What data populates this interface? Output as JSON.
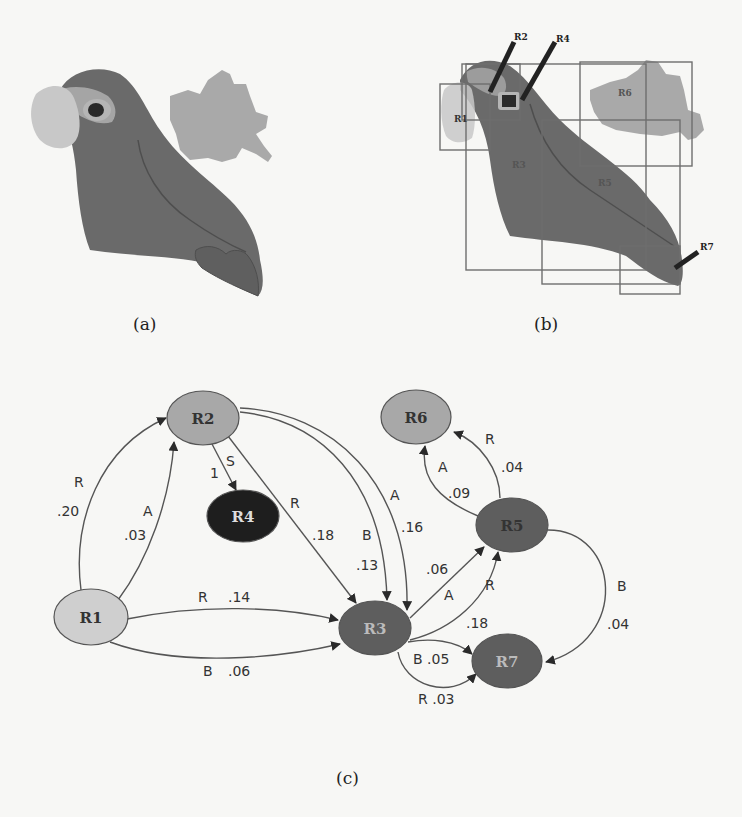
{
  "figure": {
    "panels": [
      {
        "id": "a",
        "caption": "(a)",
        "description": "Segmented parrot image with leaf"
      },
      {
        "id": "b",
        "caption": "(b)",
        "description": "Region bounding boxes overlaid on parrot"
      },
      {
        "id": "c",
        "caption": "(c)",
        "description": "Spatial relation graph between regions"
      }
    ],
    "region_labels": {
      "R1": "R1",
      "R2": "R2",
      "R3": "R3",
      "R4": "R4",
      "R5": "R5",
      "R6": "R6",
      "R7": "R7"
    },
    "colors": {
      "background": "#f7f7f5",
      "parrot_body": "#6a6a6a",
      "parrot_face": "#c8c8c8",
      "parrot_cheek": "#a5a5a5",
      "eye": "#2a2a2a",
      "leaf": "#a9a9a9",
      "box_stroke": "#6e6e6e",
      "node_R1": "#cfcfcf",
      "node_R2": "#a8a8a8",
      "node_R3": "#5e5e5e",
      "node_R4": "#1e1e1e",
      "node_R5": "#5e5e5e",
      "node_R6": "#a8a8a8",
      "node_R7": "#5e5e5e",
      "edge": "#555555"
    }
  },
  "graph": {
    "nodes": [
      {
        "id": "R1",
        "label": "R1",
        "cx": 91,
        "cy": 617
      },
      {
        "id": "R2",
        "label": "R2",
        "cx": 203,
        "cy": 418
      },
      {
        "id": "R3",
        "label": "R3",
        "cx": 375,
        "cy": 628
      },
      {
        "id": "R4",
        "label": "R4",
        "cx": 243,
        "cy": 516
      },
      {
        "id": "R5",
        "label": "R5",
        "cx": 512,
        "cy": 525
      },
      {
        "id": "R6",
        "label": "R6",
        "cx": 408,
        "cy": 418
      },
      {
        "id": "R7",
        "label": "R7",
        "cx": 507,
        "cy": 661
      }
    ],
    "edges": [
      {
        "from": "R1",
        "to": "R2",
        "relation": "R",
        "weight": ".20"
      },
      {
        "from": "R1",
        "to": "R2",
        "relation": "A",
        "weight": ".03"
      },
      {
        "from": "R2",
        "to": "R4",
        "relation": "S",
        "weight": "1"
      },
      {
        "from": "R2",
        "to": "R3",
        "relation": "R",
        "weight": ".18"
      },
      {
        "from": "R2",
        "to": "R3",
        "relation": "B",
        "weight": ".13"
      },
      {
        "from": "R2",
        "to": "R3",
        "relation": "A",
        "weight": ".16"
      },
      {
        "from": "R1",
        "to": "R3",
        "relation": "R",
        "weight": ".14"
      },
      {
        "from": "R1",
        "to": "R3",
        "relation": "B",
        "weight": ".06"
      },
      {
        "from": "R3",
        "to": "R5",
        "relation": "A",
        "weight": ".06"
      },
      {
        "from": "R3",
        "to": "R5",
        "relation": "R",
        "weight": ".18"
      },
      {
        "from": "R5",
        "to": "R6",
        "relation": "A",
        "weight": ".09"
      },
      {
        "from": "R5",
        "to": "R6",
        "relation": "R",
        "weight": ".04"
      },
      {
        "from": "R5",
        "to": "R7",
        "relation": "B",
        "weight": ".04"
      },
      {
        "from": "R3",
        "to": "R7",
        "relation": "B",
        "weight": ".05"
      },
      {
        "from": "R3",
        "to": "R7",
        "relation": "R",
        "weight": ".03"
      }
    ],
    "labels": {
      "e_r1r2_R_rel": "R",
      "e_r1r2_R_w": ".20",
      "e_r1r2_A_rel": "A",
      "e_r1r2_A_w": ".03",
      "e_r2r4_S_rel": "S",
      "e_r2r4_S_w": "1",
      "e_r2r3_R_rel": "R",
      "e_r2r3_R_w": ".18",
      "e_r2r3_B_rel": "B",
      "e_r2r3_B_w": ".13",
      "e_r2r3_A_rel": "A",
      "e_r2r3_A_w": ".16",
      "e_r1r3_R_rel": "R",
      "e_r1r3_R_w": ".14",
      "e_r1r3_B_rel": "B",
      "e_r1r3_B_w": ".06",
      "e_r3r5_A_rel": "A",
      "e_r3r5_A_w": ".06",
      "e_r3r5_R_rel": "R",
      "e_r3r5_R_w": ".18",
      "e_r5r6_A_rel": "A",
      "e_r5r6_A_w": ".09",
      "e_r5r6_R_rel": "R",
      "e_r5r6_R_w": ".04",
      "e_r5r7_B_rel": "B",
      "e_r5r7_B_w": ".04",
      "e_r3r7_B": "B .05",
      "e_r3r7_R": "R .03"
    }
  }
}
